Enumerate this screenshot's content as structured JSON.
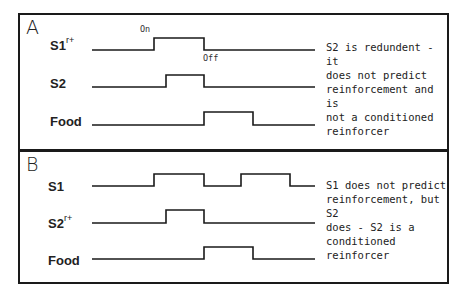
{
  "panels": [
    {
      "id": "A",
      "letter": "A",
      "rows": [
        {
          "label": "S1",
          "superscript": "r+",
          "baseline_y": 50,
          "high_y": 38,
          "pulses": [
            [
              154,
              204
            ]
          ]
        },
        {
          "label": "S2",
          "superscript": "",
          "baseline_y": 87,
          "high_y": 75,
          "pulses": [
            [
              166,
              204
            ]
          ]
        },
        {
          "label": "Food",
          "superscript": "",
          "baseline_y": 125,
          "high_y": 112,
          "pulses": [
            [
              204,
              253
            ]
          ]
        }
      ],
      "annotations": {
        "on": "On",
        "off": "Off"
      },
      "note": "S2 is redundent -  it\ndoes not predict\nreinforcement and is\nnot a conditioned\nreinforcer"
    },
    {
      "id": "B",
      "letter": "B",
      "rows": [
        {
          "label": "S1",
          "superscript": "",
          "baseline_y": 186,
          "high_y": 174,
          "pulses": [
            [
              154,
              204
            ],
            [
              241,
              290
            ]
          ]
        },
        {
          "label": "S2",
          "superscript": "r+",
          "baseline_y": 223,
          "high_y": 210,
          "pulses": [
            [
              166,
              204
            ]
          ]
        },
        {
          "label": "Food",
          "superscript": "",
          "baseline_y": 259,
          "high_y": 247,
          "pulses": [
            [
              204,
              253
            ]
          ]
        }
      ],
      "note": "S1 does not predict\nreinforcement, but S2\ndoes - S2 is a\nconditioned reinforcer"
    }
  ],
  "timeline": {
    "x_start": 92,
    "x_end": 315
  },
  "colors": {
    "line": "#1a1a1a",
    "border": "#1a1a1a",
    "background": "#ffffff"
  }
}
